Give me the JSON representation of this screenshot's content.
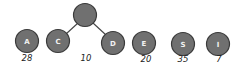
{
  "diagram": {
    "root": {
      "label": "",
      "x": 85,
      "y": 15
    },
    "nodes": [
      {
        "label": "A",
        "x": 27,
        "y": 41,
        "weight": "28"
      },
      {
        "label": "C",
        "x": 58,
        "y": 41
      },
      {
        "label": "D",
        "x": 113,
        "y": 43
      },
      {
        "label": "E",
        "x": 144,
        "y": 43,
        "weight": "20"
      },
      {
        "label": "S",
        "x": 183,
        "y": 44,
        "weight": "35"
      },
      {
        "label": "I",
        "x": 218,
        "y": 44,
        "weight": "7"
      }
    ],
    "root_weight": "10",
    "edges": [
      [
        "root",
        "C"
      ],
      [
        "root",
        "D"
      ]
    ]
  }
}
